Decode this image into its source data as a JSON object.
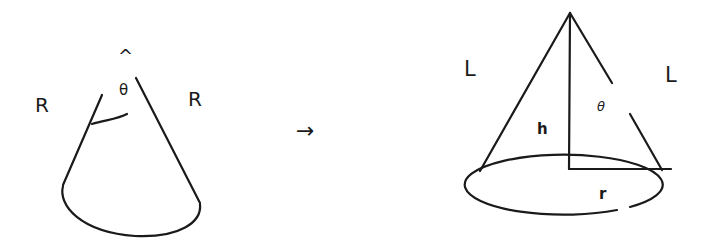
{
  "diagram": {
    "type": "cone-net-to-cone",
    "colors": {
      "stroke": "#1a1a1a",
      "background": "#ffffff"
    },
    "left_figure": {
      "name": "sector",
      "labels": {
        "apex_caret": "^",
        "angle": "θ",
        "left_radius": "R",
        "right_radius": "R"
      }
    },
    "arrow": {
      "symbol": "→"
    },
    "right_figure": {
      "name": "cone",
      "labels": {
        "left_slant": "L",
        "right_slant": "L",
        "angle": "θ",
        "height": "h",
        "radius": "r"
      }
    }
  }
}
